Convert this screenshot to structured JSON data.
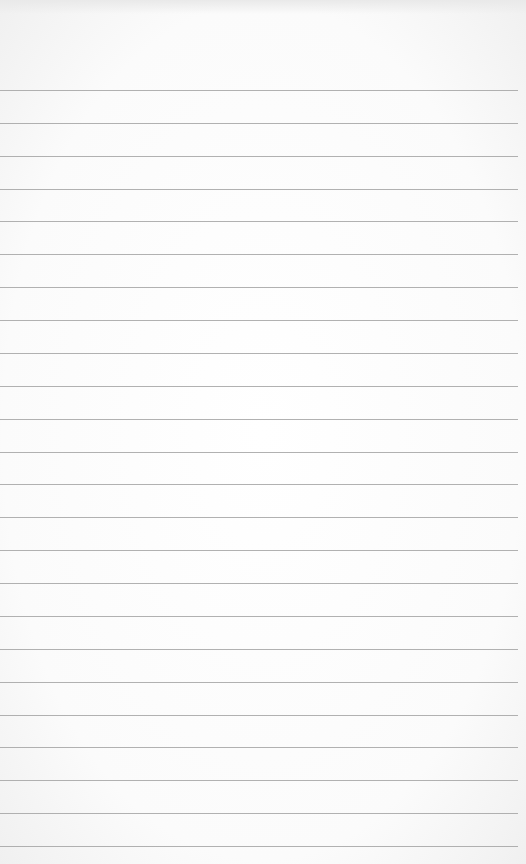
{
  "paper": {
    "type": "lined notepad sheet",
    "background_color": "#fbfbfb",
    "line_color": "#a3a3a3",
    "line_count": 24,
    "first_line_y": 90,
    "line_spacing": 32.87
  }
}
